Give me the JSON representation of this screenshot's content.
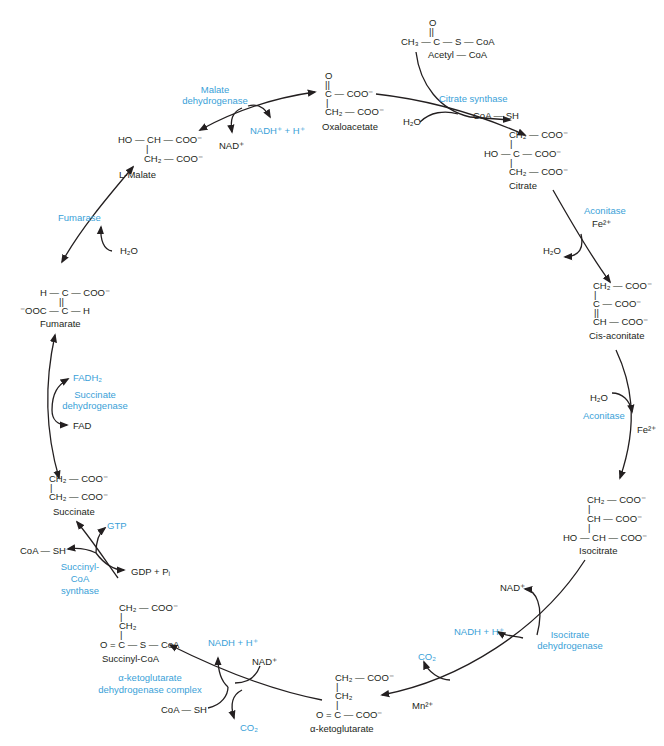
{
  "colors": {
    "enzyme": "#3a9fd8",
    "text": "#231f20",
    "arrow": "#231f20",
    "background": "#ffffff"
  },
  "molecules": {
    "acetyl_coa": {
      "line1": "O",
      "line2": "||",
      "line3": "CH₃ — C — S — CoA",
      "name": "Acetyl — CoA"
    },
    "oxaloacetate": {
      "line1": "O",
      "line2": "||",
      "line3": "C — COO⁻",
      "line4": "|",
      "line5": "CH₂ — COO⁻",
      "name": "Oxaloacetate"
    },
    "citrate": {
      "line1": "CH₂ — COO⁻",
      "line2": "|",
      "line3": "HO — C — COO⁻",
      "line4": "|",
      "line5": "CH₂ — COO⁻",
      "name": "Citrate"
    },
    "cis_aconitate": {
      "line1": "CH₂ — COO⁻",
      "line2": "|",
      "line3": "C — COO⁻",
      "line4": "||",
      "line5": "CH — COO⁻",
      "name": "Cis-aconitate"
    },
    "isocitrate": {
      "line1": "CH₂ — COO⁻",
      "line2": "|",
      "line3": "CH — COO⁻",
      "line4": "|",
      "line5": "HO — CH — COO⁻",
      "name": "Isocitrate"
    },
    "alpha_ketoglutarate": {
      "line1": "CH₂ — COO⁻",
      "line2": "|",
      "line3": "CH₂",
      "line4": "|",
      "line5": "O = C — COO⁻",
      "name": "α-ketoglutarate"
    },
    "succinyl_coa": {
      "line1": "CH₂ — COO⁻",
      "line2": "|",
      "line3": "CH₂",
      "line4": "|",
      "line5": "O = C — S — CoA",
      "name": "Succinyl-CoA"
    },
    "succinate": {
      "line1": "CH₂ — COO⁻",
      "line2": "|",
      "line3": "CH₂ — COO⁻",
      "name": "Succinate"
    },
    "fumarate": {
      "line1": "H — C — COO⁻",
      "line2": "||",
      "line3": "⁻OOC — C — H",
      "name": "Fumarate"
    },
    "malate": {
      "line1": "HO — CH — COO⁻",
      "line2": "|",
      "line3": "CH₂ — COO⁻",
      "name": "L-Malate"
    }
  },
  "enzymes": {
    "citrate_synthase": "Citrate synthase",
    "aconitase_1": "Aconitase",
    "aconitase_2": "Aconitase",
    "isocitrate_dh_1": "Isocitrate",
    "isocitrate_dh_2": "dehydrogenase",
    "akg_dh_1": "α-ketoglutarate",
    "akg_dh_2": "dehydrogenase complex",
    "succinyl_coa_synthase_1": "Succinyl-",
    "succinyl_coa_synthase_2": "CoA",
    "succinyl_coa_synthase_3": "synthase",
    "succinate_dh_1": "Succinate",
    "succinate_dh_2": "dehydrogenase",
    "fumarase": "Fumarase",
    "malate_dh_1": "Malate",
    "malate_dh_2": "dehydrogenase"
  },
  "cofactors": {
    "cs_h2o": "H₂O",
    "cs_coash": "CoA — SH",
    "acon1_fe": "Fe²⁺",
    "acon1_h2o": "H₂O",
    "acon2_h2o": "H₂O",
    "acon2_fe": "Fe²⁺",
    "idh_nad": "NAD⁺",
    "idh_nadh": "NADH + H⁺",
    "idh_co2": "CO₂",
    "idh_mn": "Mn²⁺",
    "akg_nadh": "NADH + H⁺",
    "akg_nad": "NAD⁺",
    "akg_coash": "CoA — SH",
    "akg_co2": "CO₂",
    "scs_gtp": "GTP",
    "scs_coash": "CoA — SH",
    "scs_gdp": "GDP + Pᵢ",
    "sdh_fadh2": "FADH₂",
    "sdh_fad": "FAD",
    "fum_h2o": "H₂O",
    "mdh_nad": "NAD⁺",
    "mdh_nadh": "NADH⁺ + H⁺"
  }
}
